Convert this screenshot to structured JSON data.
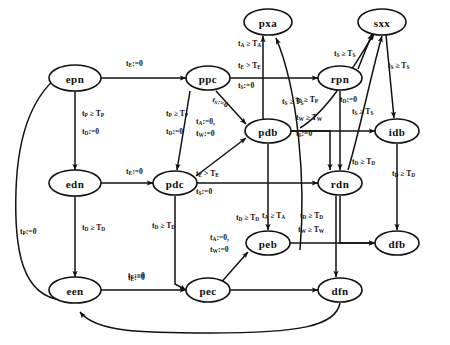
{
  "diagram": {
    "type": "state-transition-diagram",
    "background": "#ffffff",
    "ink": "#111111",
    "nodes": [
      {
        "id": "epn",
        "label": "epn",
        "x": 75,
        "y": 78
      },
      {
        "id": "ppc",
        "label": "ppc",
        "x": 208,
        "y": 78
      },
      {
        "id": "pxa",
        "label": "pxa",
        "x": 268,
        "y": 22
      },
      {
        "id": "sxx",
        "label": "sxx",
        "x": 382,
        "y": 22
      },
      {
        "id": "rpn",
        "label": "rpn",
        "x": 340,
        "y": 78
      },
      {
        "id": "pdb",
        "label": "pdb",
        "x": 268,
        "y": 131
      },
      {
        "id": "idb",
        "label": "idb",
        "x": 397,
        "y": 131
      },
      {
        "id": "edn",
        "label": "edn",
        "x": 75,
        "y": 183
      },
      {
        "id": "pdc",
        "label": "pdc",
        "x": 175,
        "y": 183
      },
      {
        "id": "rdn",
        "label": "rdn",
        "x": 340,
        "y": 183
      },
      {
        "id": "peb",
        "label": "peb",
        "x": 268,
        "y": 243
      },
      {
        "id": "dfb",
        "label": "dfb",
        "x": 397,
        "y": 243
      },
      {
        "id": "een",
        "label": "een",
        "x": 75,
        "y": 290
      },
      {
        "id": "pec",
        "label": "pec",
        "x": 208,
        "y": 290
      },
      {
        "id": "dfn",
        "label": "dfn",
        "x": 340,
        "y": 290
      }
    ],
    "edges": [
      {
        "from": "epn",
        "to": "ppc",
        "label": "tE0"
      },
      {
        "from": "epn",
        "to": "edn",
        "label": "tP_ge_TP__tD0"
      },
      {
        "from": "edn",
        "to": "een",
        "label": "tD_ge_TD"
      },
      {
        "from": "edn",
        "to": "pdc",
        "label": "tE0"
      },
      {
        "from": "een",
        "to": "pec",
        "label": "tE0"
      },
      {
        "from": "een",
        "to": "epn",
        "label": "tP0"
      },
      {
        "from": "ppc",
        "to": "pdc",
        "label": "tP_ge_TP__tD0"
      },
      {
        "from": "ppc",
        "to": "pdb",
        "label": "tS0__tA0_tW0"
      },
      {
        "from": "ppc",
        "to": "rpn",
        "label": "tE_gt_TE__tS0"
      },
      {
        "from": "ppc",
        "to": "pxa",
        "label": "tA_ge_TA"
      },
      {
        "from": "pdc",
        "to": "pdb",
        "label": "tS0__tA0_tW0"
      },
      {
        "from": "pdc",
        "to": "rdn",
        "label": "tE_gt_TE__tS0"
      },
      {
        "from": "pdc",
        "to": "pec",
        "label": "tD_ge_TD"
      },
      {
        "from": "pdb",
        "to": "peb",
        "label": "tD_ge_TD"
      },
      {
        "from": "pdb",
        "to": "rdn",
        "label": "tP_ge_TP__tW_ge_TW__tS0"
      },
      {
        "from": "pdb",
        "to": "pxa",
        "label": "tA_ge_TA"
      },
      {
        "from": "pdb",
        "to": "sxx",
        "label": "tS_ge_TS"
      },
      {
        "from": "pdb",
        "to": "idb",
        "label": "tS_ge_TS"
      },
      {
        "from": "rpn",
        "to": "sxx",
        "label": "tS_ge_TS"
      },
      {
        "from": "rpn",
        "to": "rdn",
        "label": "tP_ge_TP__tD0"
      },
      {
        "from": "rdn",
        "to": "sxx",
        "label": "tS_ge_TS"
      },
      {
        "from": "rdn",
        "to": "dfb",
        "label": "tD_ge_TD"
      },
      {
        "from": "rdn",
        "to": "dfn",
        "label": "tD_ge_TD"
      },
      {
        "from": "peb",
        "to": "pec",
        "label": "tA0_tW0"
      },
      {
        "from": "peb",
        "to": "dfb",
        "label": "tW_ge_TW"
      },
      {
        "from": "pec",
        "to": "dfn",
        "label": "tE0"
      },
      {
        "from": "idb",
        "to": "dfb",
        "label": "tD_ge_TD"
      },
      {
        "from": "sxx",
        "to": "idb",
        "label": "tS_ge_TS"
      },
      {
        "from": "dfn",
        "to": "een",
        "label": ""
      }
    ],
    "edge_labels": {
      "epn_ppc": {
        "line1": "t<sub>E</sub>:=0"
      },
      "epn_edn_1": {
        "line1": "t<sub>P</sub> ≥ T<sub>P</sub>"
      },
      "epn_edn_2": {
        "line1": "t<sub>D</sub>:=0"
      },
      "edn_een": {
        "line1": "t<sub>D</sub> ≥ T<sub>D</sub>"
      },
      "edn_pdc": {
        "line1": "t<sub>E</sub>:=0"
      },
      "een_pec": {
        "line1": "t<sub>E</sub>:=0"
      },
      "een_epn": {
        "line1": "t<sub>P</sub>:=0"
      },
      "ppc_pdc_1": {
        "line1": "t<sub>P</sub> ≥ T<sub>P</sub>"
      },
      "ppc_pdc_2": {
        "line1": "t<sub>D</sub>:=0"
      },
      "ppc_pdb_diag": {
        "line1": "t<sub>S</sub>:=0"
      },
      "ppc_pdb_reset": {
        "line1": "t<sub>A</sub>:=0,",
        "line2": "t<sub>W</sub>:=0"
      },
      "ppc_rpn_1": {
        "line1": "t<sub>E</sub> &gt; T<sub>E</sub>"
      },
      "ppc_rpn_2": {
        "line1": "t<sub>S</sub>:=0"
      },
      "ppc_pxa": {
        "line1": "t<sub>A</sub> ≥ T<sub>A</sub>"
      },
      "pdc_rdn_1": {
        "line1": "t<sub>E</sub> &gt; T<sub>E</sub>"
      },
      "pdc_rdn_2": {
        "line1": "t<sub>S</sub>:=0"
      },
      "pdc_pec": {
        "line1": "t<sub>D</sub> ≥ T<sub>D</sub>"
      },
      "pdb_peb": {
        "line1": "t<sub>D</sub> ≥ T<sub>D</sub>"
      },
      "pdb_rdn_1": {
        "line1": "t<sub>W</sub> ≥ T<sub>W</sub>"
      },
      "pdb_rdn_2": {
        "line1": "t<sub>S</sub>:=0"
      },
      "pdb_pxa": {
        "line1": "t<sub>A</sub> ≥ T<sub>A</sub>"
      },
      "pdb_sxx": {
        "line1": "t<sub>S</sub> ≥ T<sub>S</sub>"
      },
      "pdb_idb": {
        "line1": "t<sub>S</sub> ≥ T<sub>S</sub>"
      },
      "rpn_sxx": {
        "line1": "t<sub>S</sub> ≥ T<sub>S</sub>"
      },
      "rpn_rdn_1": {
        "line1": "t<sub>P</sub> ≥ T<sub>P</sub>"
      },
      "rpn_rdn_2": {
        "line1": "t<sub>D</sub>:=0"
      },
      "sxx_idb": {
        "line1": "t<sub>S</sub> ≥ T<sub>S</sub>"
      },
      "idb_dfb": {
        "line1": "t<sub>D</sub> ≥ T<sub>D</sub>"
      },
      "rdn_dfb": {
        "line1": "t<sub>D</sub> ≥ T<sub>D</sub>"
      },
      "rdn_dfn": {
        "line1": "t<sub>D</sub> ≥ T<sub>D</sub>"
      },
      "peb_pec": {
        "line1": "t<sub>A</sub>:=0,",
        "line2": "t<sub>W</sub>:=0"
      },
      "peb_dfb": {
        "line1": "t<sub>W</sub> ≥ T<sub>W</sub>"
      },
      "pec_dfn": {
        "line1": "t<sub>E</sub>:=0"
      }
    }
  }
}
